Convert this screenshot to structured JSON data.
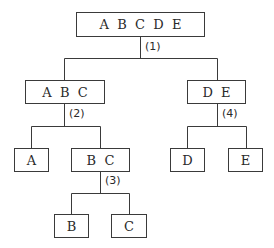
{
  "diagram": {
    "type": "binary-partition-tree",
    "nodes": {
      "root": "A  B  C  D  E",
      "abc": "A  B  C",
      "de": "D  E",
      "a": "A",
      "bc": "B  C",
      "d": "D",
      "e": "E",
      "b": "B",
      "c": "C"
    },
    "step_labels": {
      "s1": "(1)",
      "s2": "(2)",
      "s3": "(3)",
      "s4": "(4)"
    },
    "edges": [
      [
        "root",
        "abc"
      ],
      [
        "root",
        "de"
      ],
      [
        "abc",
        "a"
      ],
      [
        "abc",
        "bc"
      ],
      [
        "bc",
        "b"
      ],
      [
        "bc",
        "c"
      ],
      [
        "de",
        "d"
      ],
      [
        "de",
        "e"
      ]
    ]
  }
}
